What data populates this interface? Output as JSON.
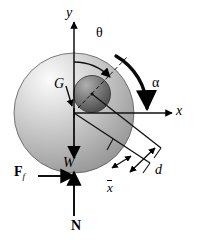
{
  "figure": {
    "kind": "free-body-diagram",
    "background_color": "#ffffff",
    "stroke_color": "#000000",
    "wheel_fill_light": "#f2f2f2",
    "wheel_fill_mid": "#b4b4b4",
    "wheel_fill_dark": "#8e8e8e",
    "hub_fill_light": "#9a9a9a",
    "hub_fill_dark": "#4a4a4a"
  },
  "axes": {
    "y_label": "y",
    "x_label": "x",
    "origin_x": 74,
    "origin_y": 113
  },
  "angles": {
    "theta_label": "θ",
    "alpha_label": "α"
  },
  "points": {
    "center_of_gravity_label": "G"
  },
  "forces": [
    {
      "name": "weight",
      "label": "W",
      "style": "italic",
      "direction": "down"
    },
    {
      "name": "friction",
      "label": "F",
      "subscript": "f",
      "style": "bold",
      "direction": "right"
    },
    {
      "name": "normal",
      "label": "N",
      "style": "bold",
      "direction": "up"
    }
  ],
  "dimensions": [
    {
      "name": "d",
      "label": "d",
      "style": "italic"
    },
    {
      "name": "x-bar",
      "label": "x",
      "style": "italic-overbar"
    }
  ]
}
